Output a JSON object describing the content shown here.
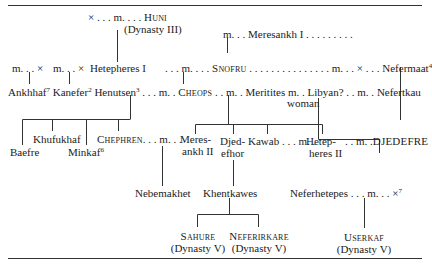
{
  "diagram": {
    "rows": {
      "r0": {
        "huni_prefix": "× . . . m. . . . ",
        "huni": "Huni",
        "huni_dynasty": "(Dynasty III)"
      },
      "r1": {
        "meresankh1": "m. . . Meresankh I . . . . . . . . ."
      },
      "r2": {
        "m_x_1": "m. . . ×",
        "m_x_2": "m. . . ×",
        "hetepheres1": "Hetepheres I",
        "m_dots": ". . . m. . . .",
        "snofru": "Snofru",
        "snofru_dots": ". . . . . . . . . . . . . . .",
        "m_x_nefermaat": "m. . . × . . .",
        "nefermaat": "Nefermaat",
        "nefermaat_note": "4"
      },
      "r3": {
        "ankhhaf": "Ankhhaf",
        "ankhhaf_note": "7",
        "kanefer": "Kanefer",
        "kanefer_note": "2",
        "henutsen": "Henutsen",
        "henutsen_note": "3",
        "m1": ". . . m. .",
        "cheops": "Cheops",
        "m2": ". . m. .",
        "meritites": "Meritites",
        "m3": "m. .",
        "libyan": "Libyan? . .",
        "woman": "woman",
        "m4": "m. .",
        "nefertkau": "Nefertkau"
      },
      "hemiunu": {
        "name": "Hemiunu",
        "note": "5"
      },
      "r4": {
        "khufukhaf": "Khufukhaf",
        "chephren": "Chephren",
        "chephren_m": ". . . m. . .",
        "meresankh2_a": "Meres-",
        "meresankh2_b": "ankh II",
        "djedefhor_a": "Djed-",
        "djedefhor_b": "efhor",
        "kawab": "Kawab",
        "kawab_m": ". . . m. .",
        "hetepheres2_a": "Hetep-",
        "hetepheres2_b": "heres II",
        "djedefre_m": ". . m. .",
        "djedefre": "Djedefre",
        "baefre": "Baefre",
        "minkaf": "Minkaf",
        "minkaf_note": "6"
      },
      "r5": {
        "nebemakhet": "Nebemakhet",
        "khentkawes": "Khentkawes",
        "neferhetepes": "Neferhetepes . . . m. . . ×",
        "neferhetepes_note": "7"
      },
      "r6": {
        "sahure": "Sahure",
        "sahure_dynasty": "(Dynasty V)",
        "neferirkare": "Neferirkare",
        "neferirkare_dynasty": "(Dynasty V)",
        "userkaf": "Userkaf",
        "userkaf_dynasty": "(Dynasty V)"
      }
    },
    "colors": {
      "ink": "#222222",
      "rule": "#333333",
      "background": "#ffffff"
    }
  }
}
